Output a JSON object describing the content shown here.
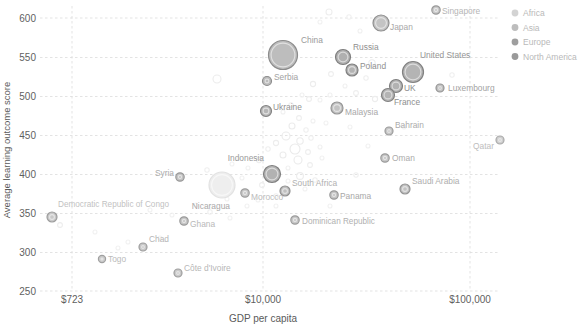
{
  "chart_data": {
    "type": "scatter",
    "title": "",
    "xlabel": "GDP per capita",
    "ylabel": "Average learning outcome score",
    "xscale": "log",
    "xtick_labels": [
      "$723",
      "$10,000",
      "$100,000"
    ],
    "xtick_values": [
      723,
      10000,
      100000
    ],
    "ytick_labels": [
      "600",
      "550",
      "500",
      "450",
      "400",
      "350",
      "300",
      "250"
    ],
    "ytick_values": [
      600,
      550,
      500,
      450,
      400,
      350,
      300,
      250
    ],
    "ylim": [
      240,
      612
    ],
    "grid": "dotted-both",
    "legend_position": "top-right",
    "legend": [
      {
        "label": "Africa",
        "color": "#d3d3d3"
      },
      {
        "label": "Asia",
        "color": "#bdbdbd"
      },
      {
        "label": "Europe",
        "color": "#9e9e9e"
      },
      {
        "label": "North America",
        "color": "#9a9a9a"
      }
    ],
    "bubble_encoding": "population",
    "points": [
      {
        "label": "Singapore",
        "x": 436,
        "y": 10,
        "r": 4.2,
        "fill": "#c9c9c9",
        "stroke": "#9a9a9a",
        "tone": "mid",
        "lx": 442,
        "ly": 14,
        "anchor": "start",
        "lcolor": "#b5b5b5"
      },
      {
        "label": "Japan",
        "x": 381,
        "y": 23,
        "r": 8.0,
        "fill": "#c4c4c4",
        "stroke": "#8f8f8f",
        "tone": "mid",
        "lx": 390,
        "ly": 30,
        "anchor": "start",
        "lcolor": "#a8a8a8"
      },
      {
        "label": "China",
        "x": 283,
        "y": 55,
        "r": 14.5,
        "fill": "#bdbdbd",
        "stroke": "#8c8c8c",
        "tone": "mid",
        "lx": 301,
        "ly": 43,
        "anchor": "start",
        "lcolor": "#9a9a9a"
      },
      {
        "label": "Russia",
        "x": 343,
        "y": 57,
        "r": 7.5,
        "fill": "#b0b0b0",
        "stroke": "#7d7d7d",
        "tone": "dark",
        "lx": 353,
        "ly": 50,
        "anchor": "start",
        "lcolor": "#8f8f8f"
      },
      {
        "label": "United States",
        "x": 413,
        "y": 72,
        "r": 10.5,
        "fill": "#b4b4b4",
        "stroke": "#818181",
        "tone": "dark",
        "lx": 420,
        "ly": 58,
        "anchor": "start",
        "lcolor": "#949494"
      },
      {
        "label": "Poland",
        "x": 352,
        "y": 70,
        "r": 6.0,
        "fill": "#b3b3b3",
        "stroke": "#7f7f7f",
        "tone": "dark",
        "lx": 360,
        "ly": 69,
        "anchor": "start",
        "lcolor": "#8f8f8f"
      },
      {
        "label": "Serbia",
        "x": 267,
        "y": 81,
        "r": 4.5,
        "fill": "#bcbcbc",
        "stroke": "#8d8d8d",
        "tone": "mid",
        "lx": 274,
        "ly": 80,
        "anchor": "start",
        "lcolor": "#a2a2a2"
      },
      {
        "label": "UK",
        "x": 396,
        "y": 86,
        "r": 6.5,
        "fill": "#b2b2b2",
        "stroke": "#7e7e7e",
        "tone": "dark",
        "lx": 404,
        "ly": 91,
        "anchor": "start",
        "lcolor": "#8d8d8d"
      },
      {
        "label": "Luxembourg",
        "x": 440,
        "y": 88,
        "r": 4.0,
        "fill": "#c2c2c2",
        "stroke": "#949494",
        "tone": "mid",
        "lx": 448,
        "ly": 91,
        "anchor": "start",
        "lcolor": "#a3a3a3"
      },
      {
        "label": "France",
        "x": 388,
        "y": 95,
        "r": 6.5,
        "fill": "#b4b4b4",
        "stroke": "#808080",
        "tone": "dark",
        "lx": 394,
        "ly": 105,
        "anchor": "start",
        "lcolor": "#8e8e8e"
      },
      {
        "label": "Ukraine",
        "x": 266,
        "y": 111,
        "r": 5.5,
        "fill": "#b6b6b6",
        "stroke": "#838383",
        "tone": "dark",
        "lx": 273,
        "ly": 110,
        "anchor": "start",
        "lcolor": "#929292"
      },
      {
        "label": "Malaysia",
        "x": 337,
        "y": 108,
        "r": 6.0,
        "fill": "#c3c3c3",
        "stroke": "#969696",
        "tone": "mid",
        "lx": 345,
        "ly": 115,
        "anchor": "start",
        "lcolor": "#a8a8a8"
      },
      {
        "label": "Bahrain",
        "x": 389,
        "y": 131,
        "r": 4.0,
        "fill": "#c6c6c6",
        "stroke": "#9a9a9a",
        "tone": "mid",
        "lx": 395,
        "ly": 128,
        "anchor": "start",
        "lcolor": "#ababab"
      },
      {
        "label": "Qatar",
        "x": 500,
        "y": 140,
        "r": 4.0,
        "fill": "#cfcfcf",
        "stroke": "#a9a9a9",
        "tone": "light",
        "lx": 494,
        "ly": 149,
        "anchor": "end",
        "lcolor": "#bdbdbd"
      },
      {
        "label": "Oman",
        "x": 385,
        "y": 158,
        "r": 4.2,
        "fill": "#c7c7c7",
        "stroke": "#9b9b9b",
        "tone": "mid",
        "lx": 392,
        "ly": 161,
        "anchor": "start",
        "lcolor": "#ababab"
      },
      {
        "label": "Indonesia",
        "x": 272,
        "y": 174,
        "r": 8.5,
        "fill": "#b2b2b2",
        "stroke": "#7f7f7f",
        "tone": "dark",
        "lx": 264,
        "ly": 161,
        "anchor": "end",
        "lcolor": "#9a9a9a"
      },
      {
        "label": "Syria",
        "x": 180,
        "y": 177,
        "r": 4.2,
        "fill": "#c4c4c4",
        "stroke": "#989898",
        "tone": "mid",
        "lx": 174,
        "ly": 176,
        "anchor": "end",
        "lcolor": "#aaaaaa"
      },
      {
        "label": "Morocco",
        "x": 245,
        "y": 193,
        "r": 4.2,
        "fill": "#c8c8c8",
        "stroke": "#9d9d9d",
        "tone": "mid",
        "lx": 251,
        "ly": 200,
        "anchor": "start",
        "lcolor": "#bcbcbc"
      },
      {
        "label": "South Africa",
        "x": 285,
        "y": 191,
        "r": 5.0,
        "fill": "#c0c0c0",
        "stroke": "#909090",
        "tone": "mid",
        "lx": 292,
        "ly": 186,
        "anchor": "start",
        "lcolor": "#b0b0b0"
      },
      {
        "label": "Nicaragua",
        "x": 222,
        "y": 185,
        "r": 13.0,
        "fill": "#eeeeee",
        "stroke": "#e2e2e2",
        "tone": "light",
        "lx": 230,
        "ly": 209,
        "anchor": "end",
        "lcolor": "#a8a8a8"
      },
      {
        "label": "Panama",
        "x": 334,
        "y": 195,
        "r": 4.2,
        "fill": "#c5c5c5",
        "stroke": "#999999",
        "tone": "mid",
        "lx": 340,
        "ly": 199,
        "anchor": "start",
        "lcolor": "#a8a8a8"
      },
      {
        "label": "Saudi Arabia",
        "x": 405,
        "y": 189,
        "r": 5.0,
        "fill": "#c2c2c2",
        "stroke": "#949494",
        "tone": "mid",
        "lx": 412,
        "ly": 184,
        "anchor": "start",
        "lcolor": "#aeaeae"
      },
      {
        "label": "Democratic Republic of Congo",
        "x": 52,
        "y": 217,
        "r": 5.0,
        "fill": "#c9c9c9",
        "stroke": "#9d9d9d",
        "tone": "mid",
        "lx": 58,
        "ly": 207,
        "anchor": "start",
        "lcolor": "#c2c2c2"
      },
      {
        "label": "Ghana",
        "x": 184,
        "y": 221,
        "r": 4.2,
        "fill": "#c6c6c6",
        "stroke": "#9a9a9a",
        "tone": "mid",
        "lx": 190,
        "ly": 227,
        "anchor": "start",
        "lcolor": "#b8b8b8"
      },
      {
        "label": "Dominican Republic",
        "x": 295,
        "y": 220,
        "r": 4.2,
        "fill": "#c7c7c7",
        "stroke": "#9b9b9b",
        "tone": "mid",
        "lx": 302,
        "ly": 224,
        "anchor": "start",
        "lcolor": "#b0b0b0"
      },
      {
        "label": "Chad",
        "x": 143,
        "y": 247,
        "r": 4.0,
        "fill": "#c8c8c8",
        "stroke": "#9c9c9c",
        "tone": "mid",
        "lx": 149,
        "ly": 242,
        "anchor": "start",
        "lcolor": "#b5b5b5"
      },
      {
        "label": "Togo",
        "x": 102,
        "y": 259,
        "r": 3.6,
        "fill": "#cbcbcb",
        "stroke": "#a0a0a0",
        "tone": "mid",
        "lx": 108,
        "ly": 262,
        "anchor": "start",
        "lcolor": "#bbbbbb"
      },
      {
        "label": "Côte d'Ivoire",
        "x": 178,
        "y": 273,
        "r": 4.0,
        "fill": "#c9c9c9",
        "stroke": "#9d9d9d",
        "tone": "mid",
        "lx": 184,
        "ly": 271,
        "anchor": "start",
        "lcolor": "#b7b7b7"
      }
    ],
    "background_points": [
      {
        "x": 217,
        "y": 79,
        "r": 4.0,
        "c": "#ececec"
      },
      {
        "x": 329,
        "y": 12,
        "r": 3.0,
        "c": "#eeeeee"
      },
      {
        "x": 349,
        "y": 17,
        "r": 2.2,
        "c": "#f0f0f0"
      },
      {
        "x": 360,
        "y": 31,
        "r": 2.0,
        "c": "#f0f0f0"
      },
      {
        "x": 320,
        "y": 22,
        "r": 2.0,
        "c": "#f1f1f1"
      },
      {
        "x": 372,
        "y": 63,
        "r": 3.2,
        "c": "#ededed"
      },
      {
        "x": 331,
        "y": 74,
        "r": 2.4,
        "c": "#eeeeee"
      },
      {
        "x": 366,
        "y": 78,
        "r": 2.2,
        "c": "#efefef"
      },
      {
        "x": 313,
        "y": 84,
        "r": 2.6,
        "c": "#ededed"
      },
      {
        "x": 345,
        "y": 86,
        "r": 2.0,
        "c": "#f0f0f0"
      },
      {
        "x": 356,
        "y": 93,
        "r": 2.4,
        "c": "#eeeeee"
      },
      {
        "x": 302,
        "y": 95,
        "r": 2.0,
        "c": "#f0f0f0"
      },
      {
        "x": 375,
        "y": 99,
        "r": 2.6,
        "c": "#ededed"
      },
      {
        "x": 320,
        "y": 100,
        "r": 2.0,
        "c": "#f1f1f1"
      },
      {
        "x": 291,
        "y": 105,
        "r": 2.2,
        "c": "#efefef"
      },
      {
        "x": 309,
        "y": 99,
        "r": 2.4,
        "c": "#ededed"
      },
      {
        "x": 330,
        "y": 95,
        "r": 2.0,
        "c": "#f0f0f0"
      },
      {
        "x": 283,
        "y": 112,
        "r": 2.0,
        "c": "#f0f0f0"
      },
      {
        "x": 299,
        "y": 118,
        "r": 2.4,
        "c": "#eeeeee"
      },
      {
        "x": 313,
        "y": 121,
        "r": 2.0,
        "c": "#f0f0f0"
      },
      {
        "x": 292,
        "y": 126,
        "r": 3.0,
        "c": "#ececec"
      },
      {
        "x": 306,
        "y": 130,
        "r": 2.2,
        "c": "#efefef"
      },
      {
        "x": 326,
        "y": 123,
        "r": 2.0,
        "c": "#f1f1f1"
      },
      {
        "x": 350,
        "y": 127,
        "r": 2.0,
        "c": "#f1f1f1"
      },
      {
        "x": 286,
        "y": 136,
        "r": 4.0,
        "c": "#ebebeb"
      },
      {
        "x": 300,
        "y": 141,
        "r": 3.2,
        "c": "#ececec"
      },
      {
        "x": 311,
        "y": 138,
        "r": 2.2,
        "c": "#efefef"
      },
      {
        "x": 276,
        "y": 143,
        "r": 2.6,
        "c": "#ededed"
      },
      {
        "x": 295,
        "y": 149,
        "r": 5.0,
        "c": "#eaeaea"
      },
      {
        "x": 308,
        "y": 152,
        "r": 2.4,
        "c": "#eeeeee"
      },
      {
        "x": 320,
        "y": 147,
        "r": 2.0,
        "c": "#f0f0f0"
      },
      {
        "x": 283,
        "y": 155,
        "r": 3.0,
        "c": "#ececec"
      },
      {
        "x": 268,
        "y": 149,
        "r": 2.2,
        "c": "#efefef"
      },
      {
        "x": 298,
        "y": 160,
        "r": 4.0,
        "c": "#ebebeb"
      },
      {
        "x": 310,
        "y": 165,
        "r": 2.4,
        "c": "#eeeeee"
      },
      {
        "x": 288,
        "y": 168,
        "r": 2.0,
        "c": "#f0f0f0"
      },
      {
        "x": 259,
        "y": 160,
        "r": 2.6,
        "c": "#ededed"
      },
      {
        "x": 322,
        "y": 158,
        "r": 2.0,
        "c": "#f1f1f1"
      },
      {
        "x": 248,
        "y": 168,
        "r": 2.0,
        "c": "#f1f1f1"
      },
      {
        "x": 300,
        "y": 176,
        "r": 3.4,
        "c": "#ececec"
      },
      {
        "x": 315,
        "y": 180,
        "r": 2.2,
        "c": "#efefef"
      },
      {
        "x": 262,
        "y": 185,
        "r": 2.4,
        "c": "#eeeeee"
      },
      {
        "x": 288,
        "y": 181,
        "r": 2.0,
        "c": "#f0f0f0"
      },
      {
        "x": 242,
        "y": 178,
        "r": 2.0,
        "c": "#f1f1f1"
      },
      {
        "x": 207,
        "y": 170,
        "r": 2.2,
        "c": "#efefef"
      },
      {
        "x": 232,
        "y": 164,
        "r": 2.0,
        "c": "#f1f1f1"
      },
      {
        "x": 276,
        "y": 196,
        "r": 2.2,
        "c": "#efefef"
      },
      {
        "x": 305,
        "y": 189,
        "r": 2.0,
        "c": "#f1f1f1"
      },
      {
        "x": 258,
        "y": 200,
        "r": 2.0,
        "c": "#f1f1f1"
      },
      {
        "x": 356,
        "y": 175,
        "r": 2.2,
        "c": "#efefef"
      },
      {
        "x": 368,
        "y": 146,
        "r": 2.0,
        "c": "#f1f1f1"
      },
      {
        "x": 404,
        "y": 127,
        "r": 2.0,
        "c": "#f1f1f1"
      },
      {
        "x": 420,
        "y": 72,
        "r": 2.2,
        "c": "#efefef"
      },
      {
        "x": 452,
        "y": 75,
        "r": 2.2,
        "c": "#efefef"
      },
      {
        "x": 60,
        "y": 225,
        "r": 2.4,
        "c": "#ededed"
      },
      {
        "x": 128,
        "y": 242,
        "r": 2.0,
        "c": "#f1f1f1"
      },
      {
        "x": 118,
        "y": 248,
        "r": 2.0,
        "c": "#f1f1f1"
      },
      {
        "x": 160,
        "y": 238,
        "r": 2.0,
        "c": "#f1f1f1"
      },
      {
        "x": 172,
        "y": 215,
        "r": 2.0,
        "c": "#f1f1f1"
      },
      {
        "x": 196,
        "y": 205,
        "r": 2.0,
        "c": "#f1f1f1"
      },
      {
        "x": 210,
        "y": 212,
        "r": 2.2,
        "c": "#efefef"
      },
      {
        "x": 230,
        "y": 218,
        "r": 2.0,
        "c": "#f1f1f1"
      },
      {
        "x": 150,
        "y": 210,
        "r": 2.0,
        "c": "#f1f1f1"
      },
      {
        "x": 95,
        "y": 232,
        "r": 2.0,
        "c": "#f1f1f1"
      },
      {
        "x": 330,
        "y": 206,
        "r": 2.0,
        "c": "#f1f1f1"
      },
      {
        "x": 276,
        "y": 206,
        "r": 2.0,
        "c": "#f1f1f1"
      },
      {
        "x": 227,
        "y": 199,
        "r": 2.0,
        "c": "#f1f1f1"
      },
      {
        "x": 247,
        "y": 206,
        "r": 2.0,
        "c": "#f1f1f1"
      }
    ]
  }
}
